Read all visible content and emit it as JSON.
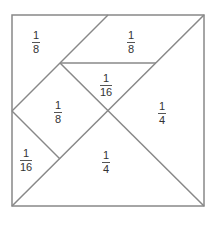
{
  "diagram": {
    "stroke_color": "#888888",
    "pieces": [
      {
        "id": "top-left",
        "label_num": "1",
        "label_den": "8",
        "x": 36,
        "y": 30
      },
      {
        "id": "top-right-parallelogram",
        "label_num": "1",
        "label_den": "8",
        "x": 131,
        "y": 30
      },
      {
        "id": "center-top-triangle",
        "label_num": "1",
        "label_den": "16",
        "x": 106,
        "y": 73
      },
      {
        "id": "left-square",
        "label_num": "1",
        "label_den": "8",
        "x": 58,
        "y": 100
      },
      {
        "id": "right-triangle",
        "label_num": "1",
        "label_den": "4",
        "x": 162,
        "y": 101
      },
      {
        "id": "bottom-left-triangle",
        "label_num": "1",
        "label_den": "16",
        "x": 26,
        "y": 148
      },
      {
        "id": "bottom-triangle",
        "label_num": "1",
        "label_den": "4",
        "x": 106,
        "y": 150
      }
    ]
  }
}
